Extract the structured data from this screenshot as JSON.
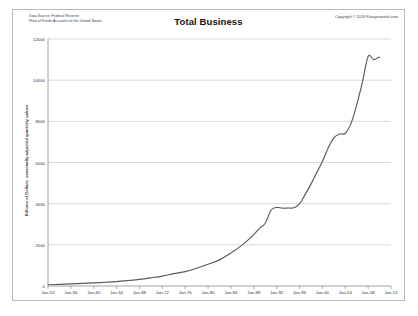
{
  "header": {
    "source_line1": "Data Source: Federal Reserve",
    "source_line2": "Flow of Funds Accounts of the United States",
    "copyright": "Copyright © 2010 Kangaroostal.com"
  },
  "chart_data": {
    "type": "line",
    "title": "Total Business",
    "xlabel": "",
    "ylabel": "Billions of Dollars, seasonally adjusted quarterly values",
    "ylim": [
      0,
      12000
    ],
    "xlim": [
      "Jan-52",
      "Jan-12"
    ],
    "grid": true,
    "legend": null,
    "line_color": "#5a5a5a",
    "ytick_labels": [
      "0",
      "2000",
      "4000",
      "6000",
      "8000",
      "10000",
      "12000"
    ],
    "ytick_values": [
      0,
      2000,
      4000,
      6000,
      8000,
      10000,
      12000
    ],
    "xtick_labels": [
      "Jan-52",
      "Jan-56",
      "Jan-60",
      "Jan-64",
      "Jan-68",
      "Jan-72",
      "Jan-76",
      "Jan-80",
      "Jan-84",
      "Jan-88",
      "Jan-92",
      "Jan-96",
      "Jan-00",
      "Jan-04",
      "Jan-08",
      "Jan-12"
    ],
    "xtick_years": [
      1952,
      1956,
      1960,
      1964,
      1968,
      1972,
      1976,
      1980,
      1984,
      1988,
      1992,
      1996,
      2000,
      2004,
      2008,
      2012
    ],
    "series": [
      {
        "name": "Total Business",
        "x": [
          1952,
          1954,
          1956,
          1958,
          1960,
          1962,
          1964,
          1966,
          1968,
          1970,
          1972,
          1974,
          1976,
          1978,
          1980,
          1982,
          1984,
          1986,
          1988,
          1989,
          1990,
          1991,
          1992,
          1993,
          1994,
          1995,
          1996,
          1997,
          1998,
          1999,
          2000,
          2001,
          2002,
          2003,
          2004,
          2005,
          2006,
          2007,
          2008,
          2009,
          2010
        ],
        "values": [
          60,
          80,
          105,
          125,
          150,
          180,
          215,
          265,
          320,
          395,
          480,
          600,
          700,
          860,
          1060,
          1270,
          1600,
          2000,
          2500,
          2800,
          3050,
          3680,
          3820,
          3780,
          3790,
          3800,
          4000,
          4450,
          4950,
          5500,
          6050,
          6700,
          7200,
          7380,
          7420,
          7900,
          8800,
          9900,
          11150,
          11000,
          11130
        ]
      }
    ]
  }
}
